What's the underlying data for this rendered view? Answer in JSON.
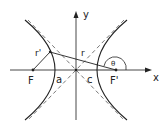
{
  "diagram": {
    "axes": {
      "x_label": "x",
      "y_label": "y"
    },
    "labels": {
      "focus_left": "F",
      "focus_right": "F'",
      "semi_major": "a",
      "focal_distance": "c",
      "radius_left": "r'",
      "radius_right": "r",
      "angle": "θ"
    },
    "colors": {
      "stroke": "#222222",
      "asymptote": "#555555",
      "highlight": "#aaaaaa"
    }
  }
}
